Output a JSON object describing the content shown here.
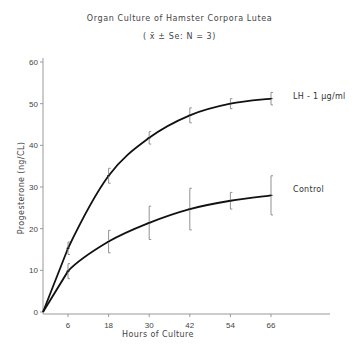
{
  "chart_data": {
    "type": "line",
    "title": "Organ Culture of Hamster Corpora Lutea",
    "subtitle": "(x̄ ± Se;  N = 3)",
    "xlabel": "Hours of Culture",
    "ylabel": "Progesterone (ng/CL)",
    "x": [
      0,
      6,
      18,
      30,
      42,
      54,
      66
    ],
    "x_ticks": [
      6,
      18,
      30,
      42,
      54,
      66
    ],
    "y_ticks": [
      0,
      10,
      20,
      30,
      40,
      50,
      60
    ],
    "xlim": [
      0,
      90
    ],
    "ylim": [
      0,
      62
    ],
    "grid": false,
    "legend_position": "inline-right-of-lines",
    "series": [
      {
        "name": "LH - 1 µg/ml",
        "values": [
          0,
          15.3,
          32.7,
          41.8,
          47.2,
          50.0,
          51.2
        ],
        "error": [
          0,
          1.5,
          1.8,
          1.5,
          1.8,
          1.2,
          1.5
        ]
      },
      {
        "name": "Control",
        "values": [
          0,
          9.8,
          16.9,
          21.4,
          24.7,
          26.7,
          28.0
        ],
        "error": [
          0,
          1.8,
          2.7,
          4.0,
          5.0,
          2.0,
          4.7
        ]
      }
    ]
  },
  "labels": {
    "title": "Organ Culture of Hamster Corpora Lutea",
    "subtitle": "( x̄ ± Se:  N = 3)",
    "xlabel": "Hours of Culture",
    "ylabel": "Progesterone (ng/CL)",
    "series_lh": "LH - 1 µg/ml",
    "series_control": "Control"
  }
}
